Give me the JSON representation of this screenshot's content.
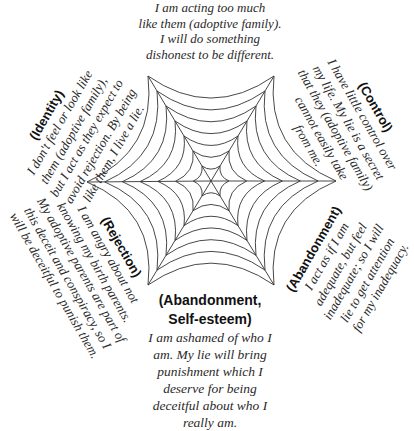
{
  "diagram": {
    "type": "spider-web-hexagon",
    "center": [
      211,
      181
    ],
    "vertices": [
      [
        148,
        76
      ],
      [
        274,
        76
      ],
      [
        336,
        181
      ],
      [
        274,
        285
      ],
      [
        148,
        285
      ],
      [
        87,
        182
      ]
    ],
    "rings": 7,
    "stroke_color": "#333333"
  },
  "top": {
    "heading": "",
    "lines": [
      "I am acting too much",
      "like them (adoptive family).",
      "I will do something",
      "dishonest to be different."
    ]
  },
  "identity": {
    "heading": "(Identity)",
    "lines": [
      "I don't feel or look like",
      "them (adoptive family),",
      "but I act as they expect to",
      "avoid rejection. By being",
      "like them, I live a lie."
    ]
  },
  "control": {
    "heading": "(Control)",
    "lines": [
      "I have little control over",
      "my life. My lie is a secret",
      "that they (adoptive family)",
      "cannot easily take",
      "from me."
    ]
  },
  "rejection": {
    "heading": "(Rejection)",
    "lines": [
      "I am angry about not",
      "knowing my birth parents.",
      "My adoptive parents are part of",
      "this deceit and conspiracy, so I",
      "will be deceitful to punish them."
    ]
  },
  "abandonment": {
    "heading": "(Abandonment)",
    "lines": [
      "I act as if I am",
      "adequate, but feel",
      "inadequate; so I will",
      "lie to get attention",
      "for my inadequacy."
    ]
  },
  "bottom": {
    "heading_lines": [
      "(Abandonment,",
      "Self-esteem)"
    ],
    "lines": [
      "I am ashamed of who I",
      "am. My lie will bring",
      "punishment which I",
      "deserve for being",
      "deceitful about who I",
      "really am."
    ]
  }
}
